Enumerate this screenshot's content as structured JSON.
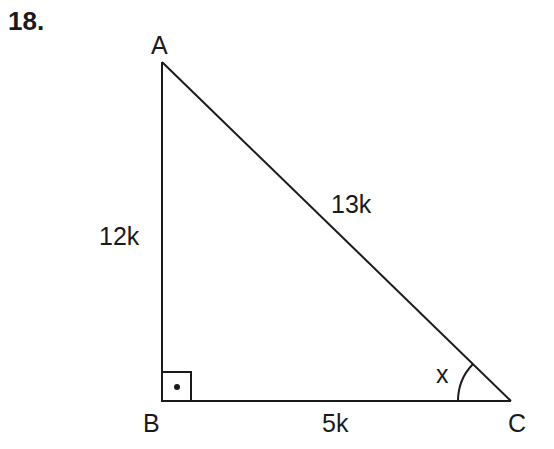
{
  "problem_number": "18.",
  "vertices": {
    "A": "A",
    "B": "B",
    "C": "C"
  },
  "sides": {
    "AB": "12k",
    "AC": "13k",
    "BC": "5k"
  },
  "angle_label": "x",
  "right_angle_at": "B"
}
